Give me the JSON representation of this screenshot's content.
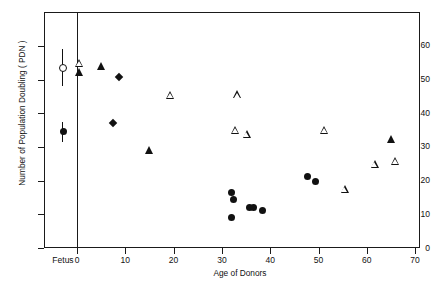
{
  "chart_data": {
    "type": "scatter",
    "title": "",
    "xlabel": "Age of Donors",
    "ylabel": "Number of Population Doubling ( PDN )",
    "xlim": [
      0,
      70
    ],
    "ylim": [
      0,
      65
    ],
    "xticks": [
      0,
      10,
      20,
      30,
      40,
      50,
      60,
      70
    ],
    "xticklabels": [
      "0",
      "10",
      "20",
      "30",
      "40",
      "50",
      "60",
      "70"
    ],
    "yticks": [
      0,
      10,
      20,
      30,
      40,
      50,
      60
    ],
    "yticklabels": [
      "0",
      "10",
      "20",
      "30",
      "40",
      "50",
      "60"
    ],
    "grid": false,
    "legend": null,
    "special_category_label": "Fetus",
    "series": [
      {
        "name": "fetus-open-circle",
        "marker": "circle-open",
        "panel": "fetus",
        "points": [
          {
            "x": "Fetus",
            "y": 53.5,
            "yerr_low": 48.0,
            "yerr_high": 59.0
          }
        ]
      },
      {
        "name": "fetus-filled-circle",
        "marker": "circle-filled",
        "panel": "fetus",
        "points": [
          {
            "x": "Fetus",
            "y": 34.5,
            "yerr_low": 31.5,
            "yerr_high": 37.5
          }
        ]
      },
      {
        "name": "open-triangles",
        "marker": "triangle-open",
        "panel": "main",
        "points": [
          {
            "x": 0.5,
            "y": 55.0
          },
          {
            "x": 19.3,
            "y": 45.5
          },
          {
            "x": 33.3,
            "y": 45.6
          },
          {
            "x": 32.9,
            "y": 35.0
          },
          {
            "x": 35.2,
            "y": 33.8
          },
          {
            "x": 51.3,
            "y": 35.0
          },
          {
            "x": 55.5,
            "y": 17.5
          },
          {
            "x": 61.7,
            "y": 25.0
          },
          {
            "x": 66.0,
            "y": 25.8
          }
        ]
      },
      {
        "name": "filled-triangles",
        "marker": "triangle-filled",
        "panel": "main",
        "points": [
          {
            "x": 0.5,
            "y": 52.3
          },
          {
            "x": 5.0,
            "y": 54.0
          },
          {
            "x": 15.0,
            "y": 29.1
          },
          {
            "x": 65.2,
            "y": 32.5
          }
        ]
      },
      {
        "name": "filled-diamonds",
        "marker": "diamond-filled",
        "panel": "main",
        "points": [
          {
            "x": 8.7,
            "y": 50.9
          },
          {
            "x": 7.4,
            "y": 37.0
          }
        ]
      },
      {
        "name": "filled-circles",
        "marker": "circle-filled",
        "panel": "main",
        "points": [
          {
            "x": 31.9,
            "y": 16.6
          },
          {
            "x": 32.3,
            "y": 14.5
          },
          {
            "x": 31.9,
            "y": 9.2
          },
          {
            "x": 35.8,
            "y": 12.0
          },
          {
            "x": 36.6,
            "y": 12.0
          },
          {
            "x": 38.5,
            "y": 11.0
          },
          {
            "x": 47.8,
            "y": 21.2
          },
          {
            "x": 49.3,
            "y": 19.7
          }
        ]
      }
    ]
  }
}
